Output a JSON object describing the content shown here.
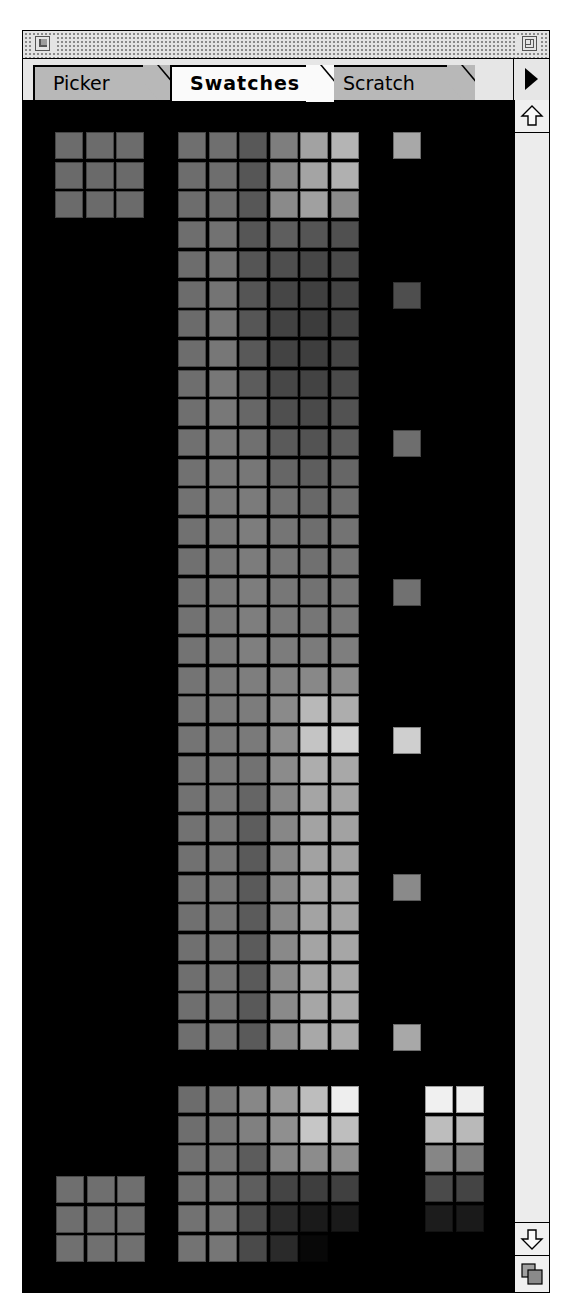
{
  "window": {
    "title_bar": {
      "close_box": "close-box",
      "zoom_box": "zoom-box"
    },
    "tabs": [
      {
        "label": "Picker",
        "active": false
      },
      {
        "label": "Swatches",
        "active": true
      },
      {
        "label": "Scratch",
        "active": false
      }
    ],
    "palette_menu_icon": "triangle-right-icon"
  },
  "scrollbar": {
    "up_arrow": "arrow-up-icon",
    "down_arrow": "arrow-down-icon",
    "resize_handle": "grow-box-icon"
  },
  "swatches": {
    "background": "#000000",
    "cell_size": [
      28,
      27
    ],
    "pitch": [
      30.6,
      29.7
    ],
    "top_left_grid": {
      "origin": [
        32,
        32
      ],
      "cols": 3,
      "rows": 3,
      "colors": [
        "#6c6c6c",
        "#6c6c6c",
        "#6c6c6c",
        "#6a6a6a",
        "#6a6a6a",
        "#6a6a6a",
        "#6b6b6b",
        "#6b6b6b",
        "#6b6b6b"
      ]
    },
    "main_grid": {
      "origin": [
        155,
        32
      ],
      "cols": 6,
      "rows": 31,
      "rows_colors": [
        [
          "#6f6f6f",
          "#6f6f6f",
          "#585858",
          "#7e7e7e",
          "#a2a2a2",
          "#b4b4b4"
        ],
        [
          "#6d6d6d",
          "#6e6e6e",
          "#565656",
          "#858585",
          "#a4a4a4",
          "#b0b0b0"
        ],
        [
          "#6d6d6d",
          "#6e6e6e",
          "#575757",
          "#8a8a8a",
          "#a0a0a0",
          "#8a8a8a"
        ],
        [
          "#6e6e6e",
          "#727272",
          "#565656",
          "#5e5e5e",
          "#555555",
          "#505050"
        ],
        [
          "#6d6d6d",
          "#737373",
          "#555555",
          "#4e4e4e",
          "#474747",
          "#4a4a4a"
        ],
        [
          "#6c6c6c",
          "#747474",
          "#555555",
          "#464646",
          "#404040",
          "#444444"
        ],
        [
          "#6b6b6b",
          "#767676",
          "#565656",
          "#424242",
          "#3c3c3c",
          "#424242"
        ],
        [
          "#6d6d6d",
          "#777777",
          "#595959",
          "#434343",
          "#3e3e3e",
          "#454545"
        ],
        [
          "#6e6e6e",
          "#777777",
          "#5c5c5c",
          "#474747",
          "#434343",
          "#4a4a4a"
        ],
        [
          "#6f6f6f",
          "#787878",
          "#676767",
          "#4f4f4f",
          "#4a4a4a",
          "#525252"
        ],
        [
          "#707070",
          "#787878",
          "#707070",
          "#5a5a5a",
          "#535353",
          "#5c5c5c"
        ],
        [
          "#717171",
          "#787878",
          "#777777",
          "#666666",
          "#5e5e5e",
          "#666666"
        ],
        [
          "#727272",
          "#797979",
          "#7b7b7b",
          "#717171",
          "#686868",
          "#6e6e6e"
        ],
        [
          "#717171",
          "#787878",
          "#7d7d7d",
          "#757575",
          "#6e6e6e",
          "#737373"
        ],
        [
          "#707070",
          "#777777",
          "#7c7c7c",
          "#767676",
          "#707070",
          "#747474"
        ],
        [
          "#717171",
          "#787878",
          "#7d7d7d",
          "#777777",
          "#727272",
          "#767676"
        ],
        [
          "#727272",
          "#787878",
          "#7e7e7e",
          "#797979",
          "#767676",
          "#797979"
        ],
        [
          "#737373",
          "#797979",
          "#7f7f7f",
          "#7c7c7c",
          "#7b7b7b",
          "#7e7e7e"
        ],
        [
          "#747474",
          "#7a7a7a",
          "#7e7e7e",
          "#828282",
          "#888888",
          "#8c8c8c"
        ],
        [
          "#757575",
          "#7a7a7a",
          "#7c7c7c",
          "#8a8a8a",
          "#b8b8b8",
          "#adadad"
        ],
        [
          "#747474",
          "#797979",
          "#7a7a7a",
          "#8d8d8d",
          "#c4c4c4",
          "#d2d2d2"
        ],
        [
          "#737373",
          "#787878",
          "#727272",
          "#8b8b8b",
          "#adadad",
          "#a8a8a8"
        ],
        [
          "#727272",
          "#777777",
          "#656565",
          "#878787",
          "#a5a5a5",
          "#a4a4a4"
        ],
        [
          "#727272",
          "#777777",
          "#5d5d5d",
          "#878787",
          "#a3a3a3",
          "#a2a2a2"
        ],
        [
          "#717171",
          "#767676",
          "#5a5a5a",
          "#878787",
          "#a2a2a2",
          "#a2a2a2"
        ],
        [
          "#717171",
          "#767676",
          "#5a5a5a",
          "#888888",
          "#a3a3a3",
          "#a3a3a3"
        ],
        [
          "#707070",
          "#757575",
          "#5b5b5b",
          "#888888",
          "#a3a3a3",
          "#a4a4a4"
        ],
        [
          "#707070",
          "#757575",
          "#5b5b5b",
          "#898989",
          "#a4a4a4",
          "#a6a6a6"
        ],
        [
          "#6f6f6f",
          "#747474",
          "#5a5a5a",
          "#8a8a8a",
          "#a5a5a5",
          "#a8a8a8"
        ],
        [
          "#6f6f6f",
          "#747474",
          "#595959",
          "#8a8a8a",
          "#a6a6a6",
          "#aaaaaa"
        ],
        [
          "#6f6f6f",
          "#747474",
          "#5a5a5a",
          "#8b8b8b",
          "#a8a8a8",
          "#ababab"
        ]
      ]
    },
    "side_column": {
      "x": 370,
      "items": [
        {
          "y": 32,
          "color": "#a8a8a8"
        },
        {
          "y": 182,
          "color": "#4e4e4e"
        },
        {
          "y": 330,
          "color": "#6e6e6e"
        },
        {
          "y": 479,
          "color": "#717171"
        },
        {
          "y": 627,
          "color": "#cfcfcf"
        },
        {
          "y": 774,
          "color": "#8a8a8a"
        },
        {
          "y": 924,
          "color": "#a8a8a8"
        }
      ]
    },
    "bottom_grid": {
      "origin": [
        155,
        986
      ],
      "cols": 6,
      "rows": 6,
      "rows_colors": [
        [
          "#6c6c6c",
          "#777777",
          "#878787",
          "#989898",
          "#bdbdbd",
          "#eeeeee"
        ],
        [
          "#6e6e6e",
          "#757575",
          "#808080",
          "#8f8f8f",
          "#c6c6c6",
          "#bebebe"
        ],
        [
          "#707070",
          "#747474",
          "#5c5c5c",
          "#858585",
          "#8c8c8c",
          "#8e8e8e"
        ],
        [
          "#717171",
          "#747474",
          "#5e5e5e",
          "#444444",
          "#3e3e3e",
          "#404040"
        ],
        [
          "#727272",
          "#757575",
          "#4c4c4c",
          "#2a2a2a",
          "#1a1a1a",
          "#1a1a1a"
        ],
        [
          "#737373",
          "#767676",
          "#4a4a4a",
          "#2a2a2a",
          "#080808",
          "#000000"
        ]
      ]
    },
    "bottom_left_grid": {
      "origin": [
        33,
        1076
      ],
      "cols": 3,
      "rows": 3,
      "colors": [
        "#6f6f6f",
        "#6f6f6f",
        "#6f6f6f",
        "#6e6e6e",
        "#6e6e6e",
        "#6e6e6e",
        "#707070",
        "#707070",
        "#707070"
      ]
    },
    "bottom_right_grid": {
      "origin": [
        402,
        986
      ],
      "cols": 2,
      "rows": 5,
      "colors": [
        "#f0f0f0",
        "#eeeeee",
        "#bdbdbd",
        "#b9b9b9",
        "#868686",
        "#7e7e7e",
        "#4a4a4a",
        "#444444",
        "#1c1c1c",
        "#1a1a1a"
      ]
    }
  }
}
